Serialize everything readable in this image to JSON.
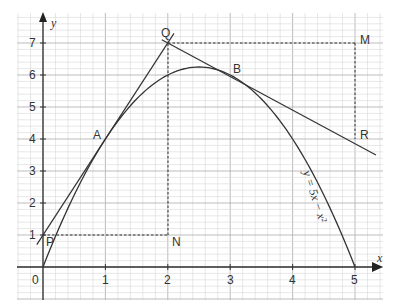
{
  "chart_data": {
    "type": "line",
    "title": "",
    "xlabel": "x",
    "ylabel": "y",
    "xlim": [
      0,
      5
    ],
    "ylim": [
      0,
      7
    ],
    "x_ticks": [
      "0",
      "1",
      "2",
      "3",
      "4",
      "5"
    ],
    "y_ticks": [
      "1",
      "2",
      "3",
      "4",
      "5",
      "6",
      "7"
    ],
    "grid": true,
    "curve": {
      "label": "y = 5x − x²",
      "equation": "y = 5x - x^2",
      "x": [
        0,
        0.5,
        1,
        1.5,
        2,
        2.5,
        3,
        3.5,
        4,
        4.5,
        5
      ],
      "y": [
        0,
        2.25,
        4,
        5.25,
        6,
        6.25,
        6,
        5.25,
        4,
        2.25,
        0
      ]
    },
    "tangents": [
      {
        "name": "tangent at A",
        "equation": "y = 3x + 1",
        "from": [
          -0.1,
          0.7
        ],
        "to": [
          2.1,
          7.3
        ]
      },
      {
        "name": "tangent at B",
        "equation": "y = -x + 9",
        "from": [
          1.9,
          7.1
        ],
        "to": [
          5.5,
          3.5
        ]
      }
    ],
    "dashed_lines": [
      {
        "from": [
          0,
          1
        ],
        "to": [
          2,
          1
        ]
      },
      {
        "from": [
          2,
          1
        ],
        "to": [
          2,
          7
        ]
      },
      {
        "from": [
          2,
          7
        ],
        "to": [
          5,
          7
        ]
      },
      {
        "from": [
          5,
          7
        ],
        "to": [
          5,
          4
        ]
      }
    ],
    "points": [
      {
        "label": "P",
        "x": 0,
        "y": 1
      },
      {
        "label": "A",
        "x": 1,
        "y": 4
      },
      {
        "label": "Q",
        "x": 2,
        "y": 7
      },
      {
        "label": "N",
        "x": 2,
        "y": 1
      },
      {
        "label": "B",
        "x": 3,
        "y": 6
      },
      {
        "label": "M",
        "x": 5,
        "y": 7
      },
      {
        "label": "R",
        "x": 5,
        "y": 4
      }
    ],
    "origin_label": "0"
  },
  "labels": {
    "x_axis": "x",
    "y_axis": "y",
    "curve_label": "y = 5x − x²",
    "P": "P",
    "A": "A",
    "Q": "Q",
    "N": "N",
    "B": "B",
    "M": "M",
    "R": "R",
    "origin": "0",
    "xt1": "1",
    "xt2": "2",
    "xt3": "3",
    "xt4": "4",
    "xt5": "5",
    "yt1": "1",
    "yt2": "2",
    "yt3": "3",
    "yt4": "4",
    "yt5": "5",
    "yt6": "6",
    "yt7": "7"
  }
}
